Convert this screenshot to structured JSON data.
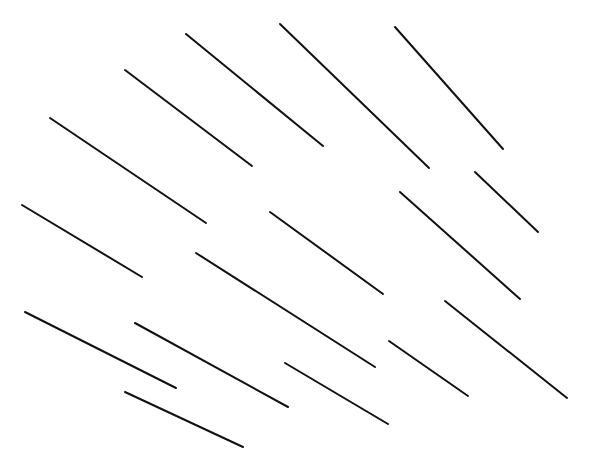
{
  "diagram": {
    "width": 589,
    "height": 472,
    "background": "#ffffff",
    "stroke_color": "#111111",
    "stroke_width": 2,
    "segments": [
      {
        "x1": 186,
        "y1": 34,
        "x2": 323,
        "y2": 146
      },
      {
        "x1": 280,
        "y1": 24,
        "x2": 429,
        "y2": 168
      },
      {
        "x1": 395,
        "y1": 27,
        "x2": 503,
        "y2": 149
      },
      {
        "x1": 125,
        "y1": 70,
        "x2": 252,
        "y2": 166
      },
      {
        "x1": 50,
        "y1": 118,
        "x2": 206,
        "y2": 223
      },
      {
        "x1": 475,
        "y1": 172,
        "x2": 538,
        "y2": 232
      },
      {
        "x1": 400,
        "y1": 192,
        "x2": 520,
        "y2": 299
      },
      {
        "x1": 22,
        "y1": 205,
        "x2": 142,
        "y2": 277
      },
      {
        "x1": 270,
        "y1": 212,
        "x2": 383,
        "y2": 294
      },
      {
        "x1": 196,
        "y1": 253,
        "x2": 375,
        "y2": 367
      },
      {
        "x1": 445,
        "y1": 301,
        "x2": 567,
        "y2": 398
      },
      {
        "x1": 25,
        "y1": 312,
        "x2": 176,
        "y2": 388
      },
      {
        "x1": 135,
        "y1": 323,
        "x2": 288,
        "y2": 407
      },
      {
        "x1": 389,
        "y1": 341,
        "x2": 468,
        "y2": 396
      },
      {
        "x1": 285,
        "y1": 363,
        "x2": 388,
        "y2": 424
      },
      {
        "x1": 125,
        "y1": 392,
        "x2": 243,
        "y2": 447
      }
    ]
  }
}
